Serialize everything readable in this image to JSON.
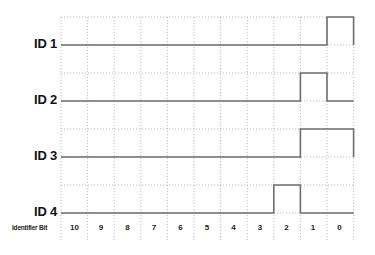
{
  "diagram": {
    "type": "timing-diagram",
    "x_axis_label": "Identifier Bit",
    "bits": [
      "10",
      "9",
      "8",
      "7",
      "6",
      "5",
      "4",
      "3",
      "2",
      "1",
      "0"
    ],
    "rows": [
      {
        "label": "ID 1",
        "levels": [
          0,
          0,
          0,
          0,
          0,
          0,
          0,
          0,
          0,
          0,
          1
        ]
      },
      {
        "label": "ID 2",
        "levels": [
          0,
          0,
          0,
          0,
          0,
          0,
          0,
          0,
          0,
          1,
          0
        ]
      },
      {
        "label": "ID 3",
        "levels": [
          0,
          0,
          0,
          0,
          0,
          0,
          0,
          0,
          0,
          1,
          1
        ]
      },
      {
        "label": "ID 4",
        "levels": [
          0,
          0,
          0,
          0,
          0,
          0,
          0,
          0,
          1,
          0,
          0
        ]
      }
    ],
    "colors": {
      "signal": "#6e6e6e",
      "grid": "#bdbdbd",
      "text": "#111111"
    }
  }
}
